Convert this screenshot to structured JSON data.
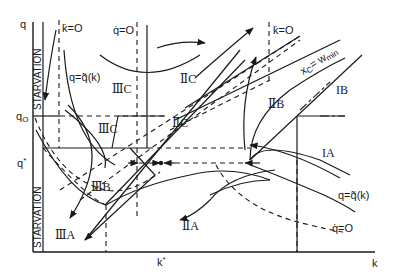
{
  "diagram": {
    "axes": {
      "x_label": "k",
      "y_label": "q",
      "x_marks": [
        "k*"
      ],
      "y_marks": [
        "q0",
        "q*"
      ]
    },
    "bands": {
      "starvation_upper": "STARVATION",
      "starvation_lower": "STARVATION"
    },
    "curve_labels": {
      "kdot_zero_left": "k̇=O",
      "qdot_zero_top": "q̇=O",
      "kdot_zero_right": "k̇=O",
      "q_tilde_left": "q=q̃(k)",
      "q_tilde_right": "q=q̃(k)",
      "qdot_zero_bottom": "q̇=O",
      "xc_wmin": "x",
      "xc_sub": "C",
      "xc_eq": "= w",
      "xc_min": "min"
    },
    "regions": {
      "IIIC_top": "ⅢC",
      "IIC_top": "ⅡC",
      "IIIC_mid": "ⅢC",
      "IIC_mid": "ⅡC",
      "IIB": "ⅡB",
      "IB": "IB",
      "IA": "IA",
      "IIIB": "ⅢB",
      "IIIA": "ⅢA",
      "IIA": "ⅡA"
    }
  }
}
